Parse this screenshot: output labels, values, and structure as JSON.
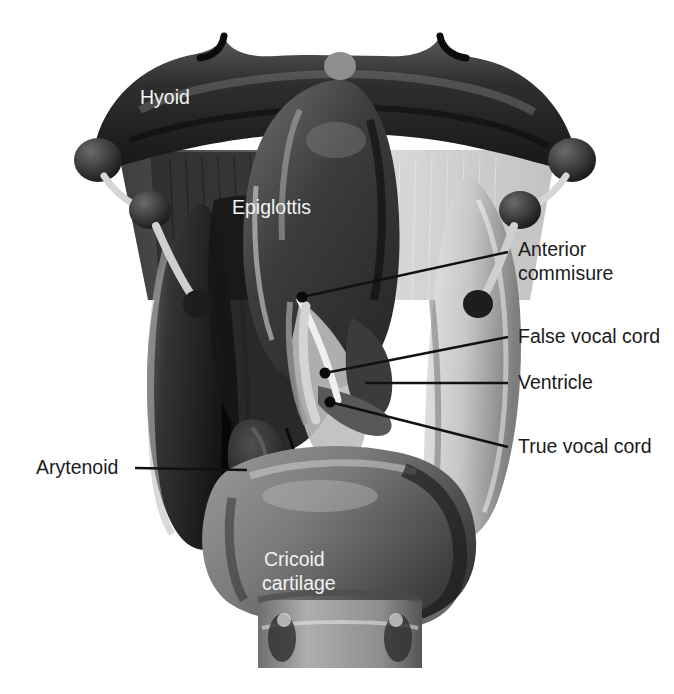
{
  "figure": {
    "background_color": "#ffffff",
    "leader_line_color": "#111111",
    "inner_label_color": "#f2f2f2",
    "outer_label_color": "#1b1b1b"
  },
  "labels": {
    "hyoid": "Hyoid",
    "epiglottis": "Epiglottis",
    "anterior_commisure_line1": "Anterior",
    "anterior_commisure_line2": "commisure",
    "false_vocal_cord": "False vocal cord",
    "ventricle": "Ventricle",
    "true_vocal_cord": "True vocal cord",
    "arytenoid": "Arytenoid",
    "cricoid_line1": "Cricoid",
    "cricoid_line2": "cartilage"
  },
  "structures": [
    {
      "name": "hyoid-bone",
      "tone": "#3a3a3a"
    },
    {
      "name": "thyrohyoid-membrane",
      "tone": "#8e8e8e"
    },
    {
      "name": "thyroid-cartilage-left-lamina",
      "tone": "#2e2e2e"
    },
    {
      "name": "thyroid-cartilage-right-lamina",
      "tone": "#b9b9b9"
    },
    {
      "name": "epiglottis",
      "tone": "#4a4a4a"
    },
    {
      "name": "arytenoid-cartilage",
      "tone": "#2a2a2a"
    },
    {
      "name": "cricoid-cartilage",
      "tone": "#787878"
    },
    {
      "name": "trachea",
      "tone": "#9a9a9a"
    },
    {
      "name": "false-vocal-cord",
      "tone": "#585858"
    },
    {
      "name": "true-vocal-cord",
      "tone": "#8a8a8a"
    },
    {
      "name": "ventricle",
      "tone": "#3f3f3f"
    }
  ],
  "leaders": [
    {
      "name": "anterior-commisure",
      "dot": [
        302,
        297
      ],
      "to": [
        508,
        252
      ],
      "dot_radius": 5
    },
    {
      "name": "false-vocal-cord",
      "dot": [
        325,
        373
      ],
      "to": [
        508,
        337
      ],
      "dot_radius": 5
    },
    {
      "name": "ventricle",
      "dot": null,
      "to": [
        508,
        383
      ],
      "from": [
        365,
        383
      ]
    },
    {
      "name": "true-vocal-cord",
      "dot": [
        330,
        402
      ],
      "to": [
        508,
        447
      ],
      "dot_radius": 5
    },
    {
      "name": "arytenoid",
      "dot": null,
      "to": [
        135,
        468
      ],
      "from": [
        247,
        470
      ]
    }
  ]
}
